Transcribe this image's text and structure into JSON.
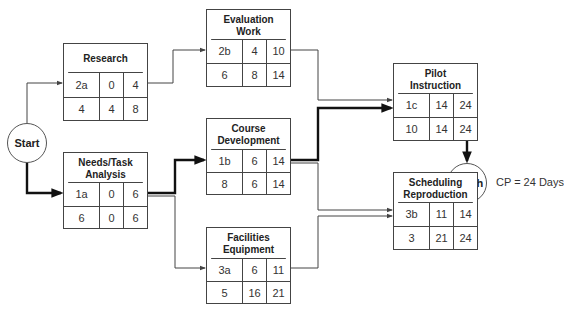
{
  "diagram": {
    "type": "critical-path-network",
    "start_label": "Start",
    "finish_label": "Finish",
    "critical_path_note": "CP = 24 Days",
    "colors": {
      "line": "#444444",
      "critical_line": "#111111",
      "background": "#ffffff"
    },
    "cell_legend_order": [
      "id",
      "early_start",
      "early_finish",
      "duration",
      "late_start/float",
      "late_finish"
    ],
    "nodes": {
      "research": {
        "title": "Research",
        "row1": [
          "2a",
          "0",
          "4"
        ],
        "row2": [
          "4",
          "4",
          "8"
        ]
      },
      "evaluation": {
        "title": "Evaluation Work",
        "row1": [
          "2b",
          "4",
          "10"
        ],
        "row2": [
          "6",
          "8",
          "14"
        ]
      },
      "pilot": {
        "title": "Pilot Instruction",
        "row1": [
          "1c",
          "14",
          "24"
        ],
        "row2": [
          "10",
          "14",
          "24"
        ]
      },
      "needs": {
        "title": "Needs/Task Analysis",
        "row1": [
          "1a",
          "0",
          "6"
        ],
        "row2": [
          "6",
          "0",
          "6"
        ]
      },
      "course": {
        "title": "Course Development",
        "row1": [
          "1b",
          "6",
          "14"
        ],
        "row2": [
          "8",
          "6",
          "14"
        ]
      },
      "facilities": {
        "title": "Facilities Equipment",
        "row1": [
          "3a",
          "6",
          "11"
        ],
        "row2": [
          "5",
          "16",
          "21"
        ]
      },
      "scheduling": {
        "title": "Scheduling Reproduction",
        "row1": [
          "3b",
          "11",
          "14"
        ],
        "row2": [
          "3",
          "21",
          "24"
        ]
      }
    },
    "edges": [
      {
        "from": "start",
        "to": "research",
        "critical": false
      },
      {
        "from": "start",
        "to": "needs",
        "critical": true
      },
      {
        "from": "research",
        "to": "evaluation",
        "critical": false
      },
      {
        "from": "evaluation",
        "to": "pilot",
        "critical": false
      },
      {
        "from": "needs",
        "to": "course",
        "critical": true
      },
      {
        "from": "needs",
        "to": "facilities",
        "critical": false
      },
      {
        "from": "course",
        "to": "pilot",
        "critical": true
      },
      {
        "from": "course",
        "to": "scheduling",
        "critical": false
      },
      {
        "from": "facilities",
        "to": "scheduling",
        "critical": false
      },
      {
        "from": "pilot",
        "to": "finish",
        "critical": true
      },
      {
        "from": "scheduling",
        "to": "finish",
        "critical": false
      }
    ]
  }
}
